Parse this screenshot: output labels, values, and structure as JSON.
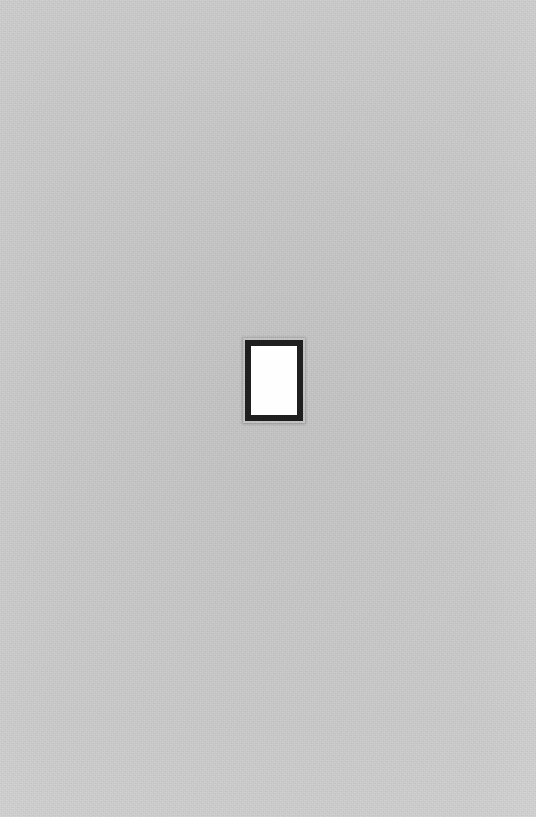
{
  "page": {
    "title": "",
    "width": 536,
    "height": 817,
    "background_color": "#cbcbcb",
    "content_description": ""
  },
  "glyph": {
    "name": "missing-glyph-box",
    "character": "",
    "border_color": "#1f1f1f",
    "fill_color": "#ffffff",
    "x": 245,
    "y": 340,
    "width": 58,
    "height": 81,
    "border_width": 6,
    "label": ""
  }
}
